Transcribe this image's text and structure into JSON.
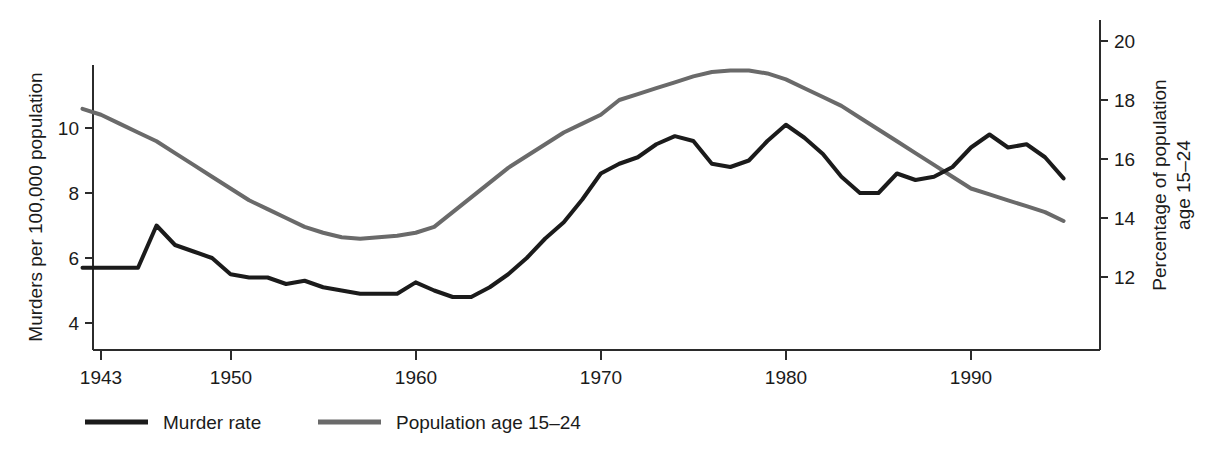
{
  "chart_data": {
    "type": "line",
    "title": "",
    "xlabel": "",
    "xlim": [
      1942,
      1996
    ],
    "xticks": [
      1943,
      1950,
      1960,
      1970,
      1980,
      1990
    ],
    "xtick_labels": [
      "1943",
      "1950",
      "1960",
      "1970",
      "1980",
      "1990"
    ],
    "grid": false,
    "legend_position": "bottom-left",
    "axes": [
      {
        "id": "left",
        "label": "Murders per 100,000 population",
        "ticks": [
          4,
          6,
          8,
          10
        ],
        "tick_labels": [
          "4",
          "6",
          "8",
          "10"
        ],
        "range": [
          3.2,
          11.5
        ]
      },
      {
        "id": "right",
        "label": "Percentage of population age 15–24",
        "label_line1": "Percentage of population",
        "label_line2": "age 15–24",
        "ticks": [
          12,
          14,
          16,
          18,
          20
        ],
        "tick_labels": [
          "12",
          "14",
          "16",
          "18",
          "20"
        ],
        "range": [
          10.5,
          20.9
        ]
      }
    ],
    "series": [
      {
        "name": "Murder rate",
        "axis": "left",
        "color": "#1b1b1b",
        "linewidth": 4,
        "x": [
          1942,
          1943,
          1944,
          1945,
          1946,
          1947,
          1948,
          1949,
          1950,
          1951,
          1952,
          1953,
          1954,
          1955,
          1956,
          1957,
          1958,
          1959,
          1960,
          1961,
          1962,
          1963,
          1964,
          1965,
          1966,
          1967,
          1968,
          1969,
          1970,
          1971,
          1972,
          1973,
          1974,
          1975,
          1976,
          1977,
          1978,
          1979,
          1980,
          1981,
          1982,
          1983,
          1984,
          1985,
          1986,
          1987,
          1988,
          1989,
          1990,
          1991,
          1992,
          1993,
          1994,
          1995
        ],
        "values": [
          5.7,
          5.7,
          5.7,
          5.7,
          7.0,
          6.4,
          6.2,
          6.0,
          5.5,
          5.4,
          5.4,
          5.2,
          5.3,
          5.1,
          5.0,
          4.9,
          4.9,
          4.9,
          5.25,
          5.0,
          4.8,
          4.8,
          5.1,
          5.5,
          6.0,
          6.6,
          7.1,
          7.8,
          8.6,
          8.9,
          9.1,
          9.5,
          9.75,
          9.6,
          8.9,
          8.8,
          9.0,
          9.6,
          10.1,
          9.7,
          9.2,
          8.5,
          8.0,
          8.0,
          8.6,
          8.4,
          8.5,
          8.8,
          9.4,
          9.8,
          9.4,
          9.5,
          9.1,
          8.45
        ]
      },
      {
        "name": "Population age 15–24",
        "axis": "right",
        "color": "#6a6a6a",
        "linewidth": 4,
        "x": [
          1942,
          1943,
          1944,
          1945,
          1946,
          1947,
          1948,
          1949,
          1950,
          1951,
          1952,
          1953,
          1954,
          1955,
          1956,
          1957,
          1958,
          1959,
          1960,
          1961,
          1962,
          1963,
          1964,
          1965,
          1966,
          1967,
          1968,
          1969,
          1970,
          1971,
          1972,
          1973,
          1974,
          1975,
          1976,
          1977,
          1978,
          1979,
          1980,
          1981,
          1982,
          1983,
          1984,
          1985,
          1986,
          1987,
          1988,
          1989,
          1990,
          1991,
          1992,
          1993,
          1994,
          1995
        ],
        "values": [
          17.7,
          17.5,
          17.2,
          16.9,
          16.6,
          16.2,
          15.8,
          15.4,
          15.0,
          14.6,
          14.3,
          14.0,
          13.7,
          13.5,
          13.35,
          13.3,
          13.35,
          13.4,
          13.5,
          13.7,
          14.2,
          14.7,
          15.2,
          15.7,
          16.1,
          16.5,
          16.9,
          17.2,
          17.5,
          18.0,
          18.2,
          18.4,
          18.6,
          18.8,
          18.95,
          19.0,
          19.0,
          18.9,
          18.7,
          18.4,
          18.1,
          17.8,
          17.4,
          17.0,
          16.6,
          16.2,
          15.8,
          15.4,
          15.0,
          14.8,
          14.6,
          14.4,
          14.2,
          13.9
        ]
      }
    ]
  },
  "legend": {
    "items": [
      {
        "label": "Murder rate",
        "color": "#1b1b1b"
      },
      {
        "label": "Population age 15–24",
        "color": "#6a6a6a"
      }
    ]
  }
}
